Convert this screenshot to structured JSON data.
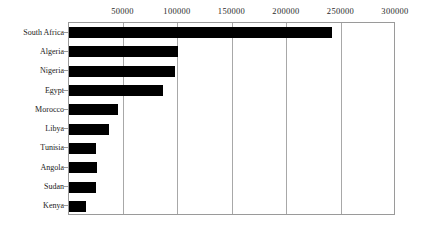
{
  "chart": {
    "type": "barh",
    "title": "",
    "xlabel": "",
    "ylabel": ""
  },
  "chart_data": {
    "type": "bar",
    "orientation": "horizontal",
    "title": "",
    "xlabel": "",
    "ylabel": "",
    "xlim": [
      0,
      300000
    ],
    "grid": true,
    "legend": null,
    "xticks": [
      "50000",
      "100000",
      "150000",
      "200000",
      "250000",
      "300000"
    ],
    "xtick_values": [
      50000,
      100000,
      150000,
      200000,
      250000,
      300000
    ],
    "categories": [
      "South Africa",
      "Algeria",
      "Nigeria",
      "Egypt",
      "Morocco",
      "Libya",
      "Tunisia",
      "Angola",
      "Sudan",
      "Kenya"
    ],
    "values": [
      241000,
      100000,
      97000,
      86000,
      45000,
      37000,
      25000,
      26000,
      25000,
      16000
    ]
  }
}
